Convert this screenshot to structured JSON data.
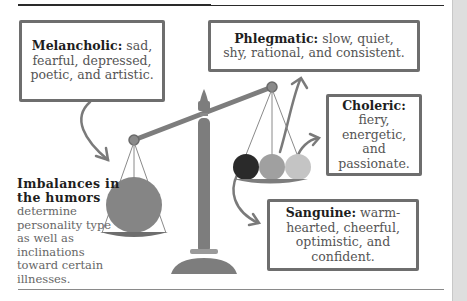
{
  "diagram": {
    "caption": {
      "heading": "Imbalances in the humors",
      "body": "determine personality type as well as inclinations toward certain illnesses."
    },
    "temperaments": [
      {
        "name": "Melancholic:",
        "description": "sad, fearful, depressed, poetic, and artistic.",
        "color": "#858585"
      },
      {
        "name": "Phlegmatic:",
        "description": "slow, quiet, shy, rational, and consistent.",
        "color": "#c4c4c4"
      },
      {
        "name": "Choleric:",
        "description": "fiery, energetic, and passionate.",
        "color": "#a0a0a0"
      },
      {
        "name": "Sanguine:",
        "description": "warm-hearted, cheerful, optimistic, and confident.",
        "color": "#2a2a2a"
      }
    ],
    "colors": {
      "scale": "#7d7d7d",
      "box_border": "#6e6e6e",
      "arrow": "#7a7a7a"
    }
  }
}
